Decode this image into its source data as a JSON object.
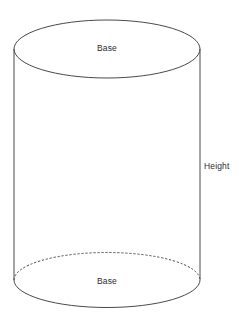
{
  "figure": {
    "kind": "cylinder-diagram",
    "background_color": "#ffffff",
    "stroke_color": "#4a4a4a",
    "text_color": "#2b2b2b",
    "labels": {
      "base_top": "Base",
      "base_bottom": "Base",
      "height": "Height"
    },
    "geometry": {
      "left_x": 14,
      "right_x": 200,
      "top_center_y": 49,
      "bottom_center_y": 280,
      "radius_x": 93,
      "top_radius_y": 29,
      "bottom_radius_y": 27.5,
      "hidden_edge_style": "dashed"
    },
    "parts": [
      {
        "name": "top-base-ellipse",
        "style": "solid"
      },
      {
        "name": "bottom-base-front-arc",
        "style": "solid"
      },
      {
        "name": "bottom-base-back-arc",
        "style": "dashed"
      },
      {
        "name": "left-side-line",
        "style": "solid"
      },
      {
        "name": "right-side-line",
        "style": "solid"
      }
    ]
  }
}
